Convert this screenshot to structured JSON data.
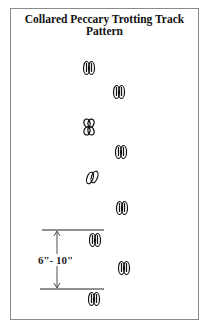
{
  "title": "Collared Peccary Trotting Track Pattern",
  "measurement": {
    "label": "6\"- 10\""
  },
  "tracks": [
    {
      "x": 89,
      "y": 68,
      "style": "paired"
    },
    {
      "x": 119,
      "y": 92,
      "style": "paired"
    },
    {
      "x": 89,
      "y": 127,
      "style": "crossed"
    },
    {
      "x": 121,
      "y": 152,
      "style": "paired"
    },
    {
      "x": 92,
      "y": 177,
      "style": "tilted"
    },
    {
      "x": 122,
      "y": 208,
      "style": "paired"
    },
    {
      "x": 95,
      "y": 240,
      "style": "paired"
    },
    {
      "x": 124,
      "y": 268,
      "style": "paired"
    },
    {
      "x": 94,
      "y": 299,
      "style": "paired"
    }
  ],
  "colors": {
    "ink": "#111111",
    "frame": "#8a8a8a"
  }
}
